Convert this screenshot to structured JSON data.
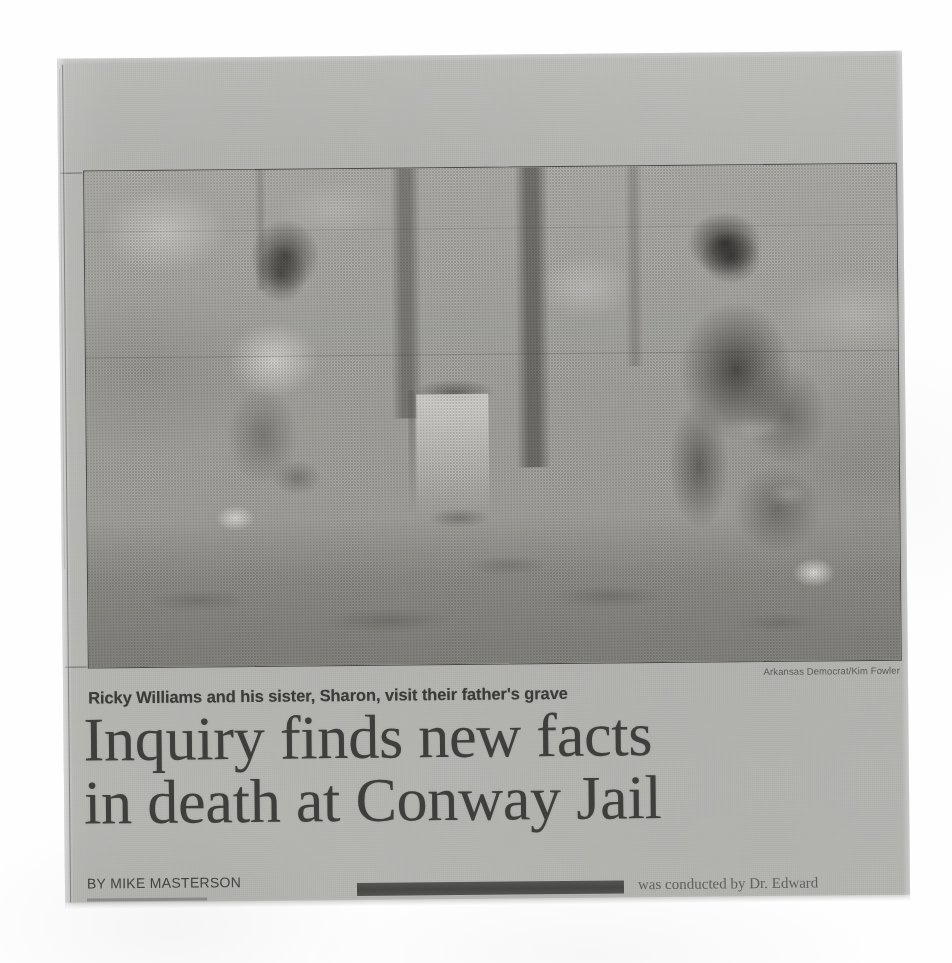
{
  "document": {
    "type": "newspaper-clipping-scan",
    "publication": "Arkansas Democrat"
  },
  "photo": {
    "alt_description": "Two people crouched on either side of a small grave marker in a wooded area",
    "credit": "Arkansas Democrat/Kim Fowler",
    "caption": "Ricky Williams and his sister, Sharon, visit their father's grave"
  },
  "headline": {
    "line1": "Inquiry finds new facts",
    "line2": "in death at Conway Jail"
  },
  "byline": {
    "text": "BY MIKE MASTERSON"
  },
  "body": {
    "fragment": "was conducted by Dr. Edward"
  },
  "colors": {
    "scan_background": "#fefefe",
    "newsprint": "#b9b9b6",
    "ink": "#3a3a38",
    "photo_frame": "#4a4a48",
    "redaction": "#44444 2"
  }
}
